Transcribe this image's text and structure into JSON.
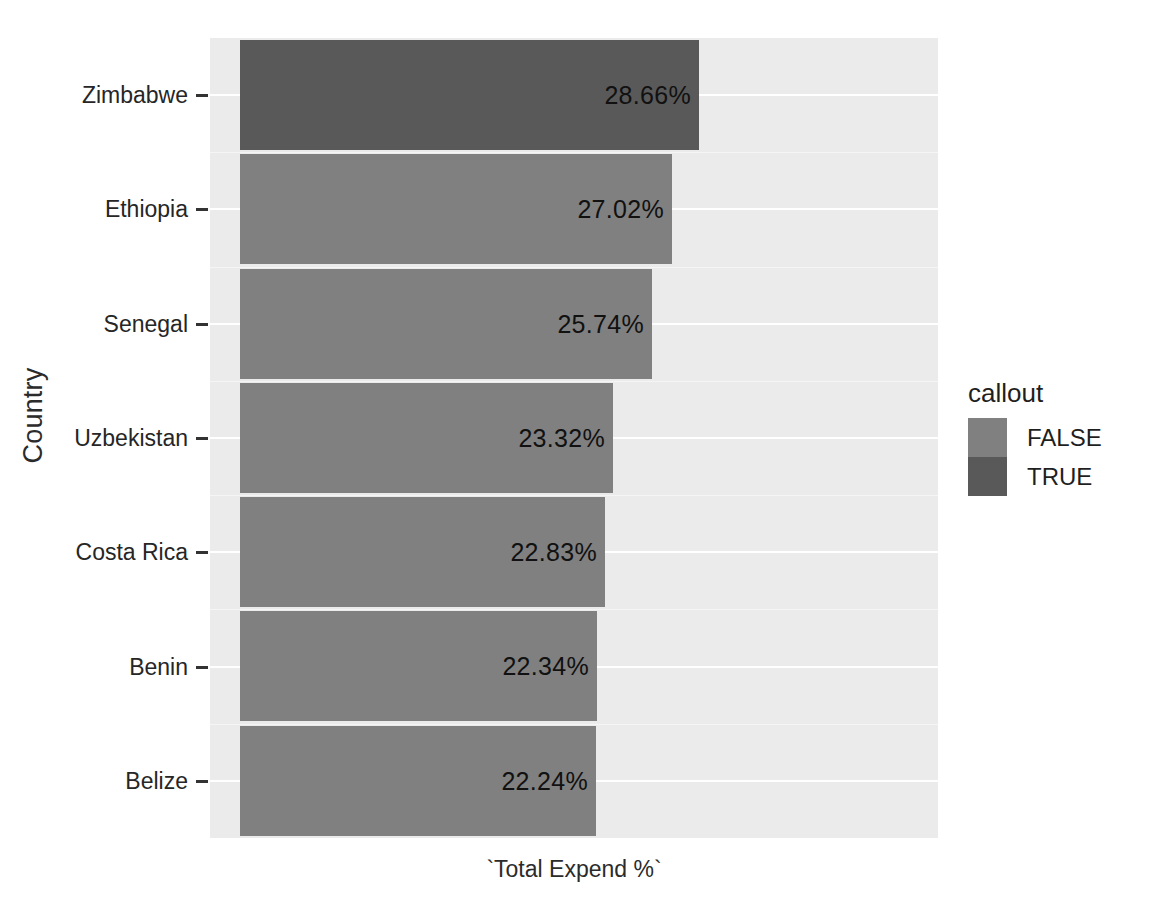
{
  "chart_data": {
    "type": "bar",
    "orientation": "horizontal",
    "title": "",
    "xlabel": "`Total Expend %`",
    "ylabel": "Country",
    "categories": [
      "Zimbabwe",
      "Ethiopia",
      "Senegal",
      "Uzbekistan",
      "Costa Rica",
      "Benin",
      "Belize"
    ],
    "values": [
      28.66,
      27.02,
      25.74,
      23.32,
      22.83,
      22.34,
      22.24
    ],
    "data_labels": [
      "28.66%",
      "27.02%",
      "25.74%",
      "23.32%",
      "22.83%",
      "22.34%",
      "22.24%"
    ],
    "series": [
      {
        "name": "callout",
        "points": [
          {
            "category": "Zimbabwe",
            "value": 28.66,
            "label": "28.66%",
            "callout": "TRUE"
          },
          {
            "category": "Ethiopia",
            "value": 27.02,
            "label": "27.02%",
            "callout": "FALSE"
          },
          {
            "category": "Senegal",
            "value": 25.74,
            "label": "25.74%",
            "callout": "FALSE"
          },
          {
            "category": "Uzbekistan",
            "value": 23.32,
            "label": "23.32%",
            "callout": "FALSE"
          },
          {
            "category": "Costa Rica",
            "value": 22.83,
            "label": "22.83%",
            "callout": "FALSE"
          },
          {
            "category": "Benin",
            "value": 22.34,
            "label": "22.34%",
            "callout": "FALSE"
          },
          {
            "category": "Belize",
            "value": 22.24,
            "label": "22.24%",
            "callout": "FALSE"
          }
        ]
      }
    ],
    "xlim": [
      0,
      33
    ],
    "grid": true,
    "legend_position": "right",
    "legend": {
      "title": "callout",
      "entries": [
        {
          "label": "FALSE",
          "color": "#808080"
        },
        {
          "label": "TRUE",
          "color": "#595959"
        }
      ]
    },
    "colors": {
      "false_fill": "#808080",
      "true_fill": "#595959",
      "panel_background": "#ebebeb",
      "gridline": "#ffffff",
      "page_background": "#ffffff",
      "text": "#1f1f1f"
    }
  }
}
